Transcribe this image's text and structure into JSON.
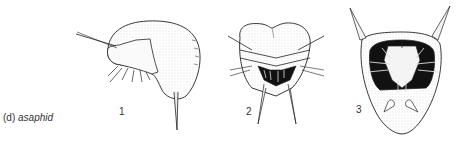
{
  "caption": {
    "label": "(d)",
    "taxon": "asaphid"
  },
  "figures": [
    {
      "number": "1",
      "view": "lateral"
    },
    {
      "number": "2",
      "view": "anterior"
    },
    {
      "number": "3",
      "view": "ventral"
    }
  ],
  "colors": {
    "ink": "#222222",
    "stipple": "#bdbdbd",
    "background": "#ffffff"
  }
}
